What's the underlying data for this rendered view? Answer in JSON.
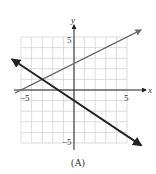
{
  "chart_data": {
    "type": "line",
    "title": "",
    "caption": "(A)",
    "xlabel": "x",
    "ylabel": "y",
    "xlim": [
      -5,
      5
    ],
    "ylim": [
      -5,
      5
    ],
    "x_ticks_labeled": [
      -5,
      5
    ],
    "y_ticks_labeled": [
      5,
      -5
    ],
    "x_tick_labels": [
      "−5",
      "5"
    ],
    "y_tick_labels": [
      "5",
      "−5"
    ],
    "grid": true,
    "grid_step": 1,
    "series": [
      {
        "name": "line-1",
        "color": "#6b6b6b",
        "width": 1.3,
        "slope": 0.5,
        "intercept": 2.5,
        "x": [
          -5.5,
          6.3
        ],
        "y": [
          -0.25,
          5.65
        ],
        "arrows": "end"
      },
      {
        "name": "line-2",
        "color": "#222222",
        "width": 1.9,
        "slope": -0.6667,
        "intercept": -1,
        "x": [
          -5.8,
          6.3
        ],
        "y": [
          2.87,
          -5.2
        ],
        "arrows": "both"
      }
    ],
    "intersection": [
      -3,
      1
    ]
  },
  "labels": {
    "x_axis": "x",
    "y_axis": "y",
    "x_neg": "−5",
    "x_pos": "5",
    "y_pos": "5",
    "y_neg": "−5",
    "caption": "(A)"
  },
  "colors": {
    "grid": "#cfcfcf",
    "axis": "#222222",
    "text": "#333333"
  }
}
